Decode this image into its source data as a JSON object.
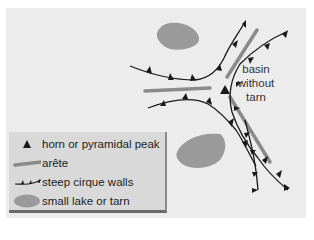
{
  "diagram": {
    "annotation": {
      "line1": "basin",
      "line2": "without",
      "line3": "tarn"
    },
    "legend": [
      {
        "symbol": "horn-triangle-icon",
        "label": "horn or pyramidal peak"
      },
      {
        "symbol": "arete-line-icon",
        "label": "arête"
      },
      {
        "symbol": "cirque-wall-icon",
        "label": "steep cirque walls"
      },
      {
        "symbol": "lake-icon",
        "label": "small lake or tarn"
      }
    ],
    "colors": {
      "background": "#ececec",
      "arete": "#8a8a8a",
      "lake": "#9a9a9a",
      "cirque_wall": "#1a1a1a",
      "horn": "#1a1a1a",
      "legend_bg": "#d9d9d9"
    }
  }
}
